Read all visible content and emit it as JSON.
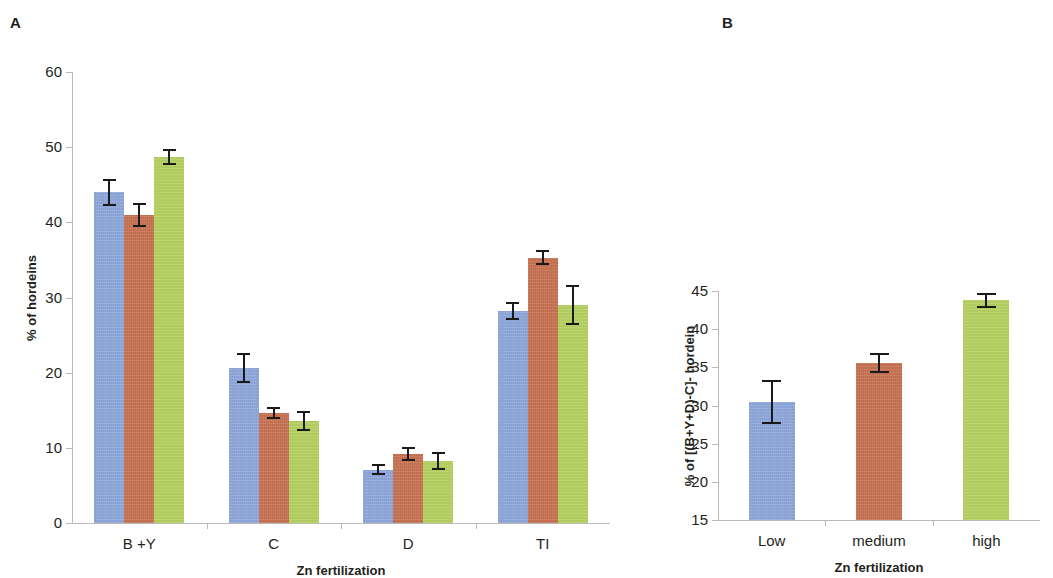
{
  "figure": {
    "panel_a_letter": "A",
    "panel_b_letter": "B"
  },
  "colors": {
    "series_low": "#8ca6dc",
    "series_medium": "#c8704f",
    "series_high": "#b5d25e",
    "axis": "#b9b9b9",
    "error_bar": "#1a1a1a",
    "text": "#231f20"
  },
  "chart_data": [
    {
      "type": "bar",
      "panel": "A",
      "title": "",
      "xlabel": "Zn fertilization",
      "ylabel": "% of hordeins",
      "ylim": [
        0,
        60
      ],
      "yticks": [
        0,
        10,
        20,
        30,
        40,
        50,
        60
      ],
      "ytick_labels": [
        "0",
        "10",
        "20",
        "30",
        "40",
        "50",
        "60"
      ],
      "grid": false,
      "legend": "none",
      "categories": [
        "B +Y",
        "C",
        "D",
        "TI"
      ],
      "series": [
        {
          "name": "Low",
          "color": "#8ca6dc",
          "values": [
            44.0,
            20.6,
            7.1,
            28.2
          ],
          "errors": [
            1.8,
            2.0,
            0.7,
            1.2
          ]
        },
        {
          "name": "medium",
          "color": "#c8704f",
          "values": [
            41.0,
            14.6,
            9.2,
            35.3
          ],
          "errors": [
            1.6,
            0.8,
            0.9,
            1.0
          ]
        },
        {
          "name": "high",
          "color": "#b5d25e",
          "values": [
            48.7,
            13.6,
            8.2,
            29.0
          ],
          "errors": [
            1.1,
            1.3,
            1.2,
            2.7
          ]
        }
      ]
    },
    {
      "type": "bar",
      "panel": "B",
      "title": "",
      "xlabel": "Zn fertilization",
      "ylabel": "% of [(B+Y+D)-C]- hordein",
      "ylim": [
        15,
        45
      ],
      "yticks": [
        15,
        20,
        25,
        30,
        35,
        40,
        45
      ],
      "ytick_labels": [
        "15",
        "20",
        "25",
        "30",
        "35",
        "40",
        "45"
      ],
      "grid": false,
      "legend": "none",
      "categories": [
        "Low",
        "medium",
        "high"
      ],
      "series": [
        {
          "name": "Zn fertilization level",
          "colors": [
            "#8ca6dc",
            "#c8704f",
            "#b5d25e"
          ],
          "values": [
            30.5,
            35.6,
            43.8
          ],
          "errors": [
            2.9,
            1.3,
            1.0
          ]
        }
      ]
    }
  ]
}
